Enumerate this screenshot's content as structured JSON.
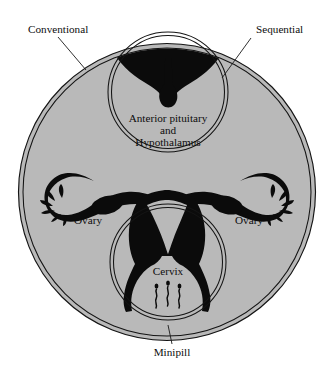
{
  "figure": {
    "title": "Sites of action of oral contraceptives on the female reproductive system",
    "callouts": {
      "conventional": "Conventional",
      "sequential": "Sequential",
      "minipill": "Minipill"
    },
    "labels": {
      "pituitary_line1": "Anterior pituitary",
      "pituitary_line2": "and",
      "pituitary_line3": "Hypothalamus",
      "ovary_left": "Ovary",
      "ovary_right": "Ovary",
      "cervix": "Cervix"
    },
    "colors": {
      "background": "#ffffff",
      "field_fill": "#b9b9b9",
      "outline": "#141414",
      "organ_fill": "#0b0b0b",
      "text": "#0d0d0d"
    },
    "geometry": {
      "outer_circle": "center 167,192 r 149 double ring",
      "pituitary_circle": "center 168,92 r 60 double ring",
      "cervix_circle": "center 168,262 r 58 double ring"
    },
    "icon_names": {
      "sperm": "sperm-icon",
      "ovary": "ovary-icon",
      "fallopian_tube": "fallopian-tube-icon",
      "uterus": "uterus-icon",
      "hypothalamus": "hypothalamus-icon",
      "pituitary": "pituitary-gland-icon"
    }
  }
}
